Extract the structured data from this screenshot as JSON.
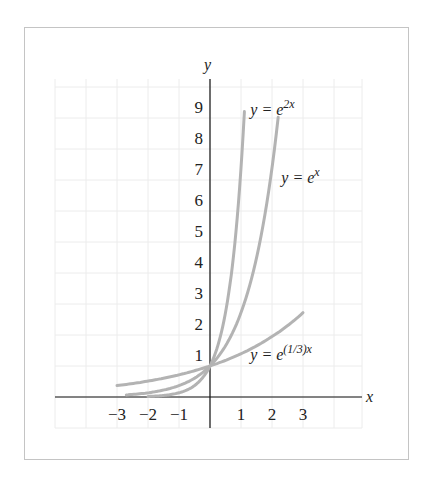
{
  "chart_data": {
    "type": "line",
    "title": "",
    "xlabel": "x",
    "ylabel": "y",
    "xlim": [
      -5,
      5
    ],
    "ylim": [
      -1,
      10
    ],
    "grid": true,
    "x_ticks": [
      "−3",
      "−2",
      "−1",
      "1",
      "2",
      "3"
    ],
    "x_tick_values": [
      -3,
      -2,
      -1,
      1,
      2,
      3
    ],
    "y_ticks": [
      "1",
      "2",
      "3",
      "4",
      "5",
      "6",
      "7",
      "8",
      "9"
    ],
    "y_tick_values": [
      1,
      2,
      3,
      4,
      5,
      6,
      7,
      8,
      9
    ],
    "series": [
      {
        "name": "y = e^{2x}",
        "label_base": "y = e",
        "label_exp": "2x",
        "k": 2,
        "x_range": [
          -2.0,
          1.11
        ],
        "label_pos": [
          1.3,
          9.1
        ]
      },
      {
        "name": "y = e^{x}",
        "label_base": "y = e",
        "label_exp": "x",
        "k": 1,
        "x_range": [
          -2.7,
          2.2
        ],
        "label_pos": [
          2.3,
          6.9
        ]
      },
      {
        "name": "y = e^{(1/3)x}",
        "label_base": "y = e",
        "label_exp": "(1/3)x",
        "k": 0.3333,
        "x_range": [
          -3.0,
          3.0
        ],
        "label_pos": [
          1.3,
          1.2
        ]
      }
    ],
    "curve_color": "#b3b3b3",
    "axis_color": "#111111",
    "grid_color": "#ececec"
  }
}
